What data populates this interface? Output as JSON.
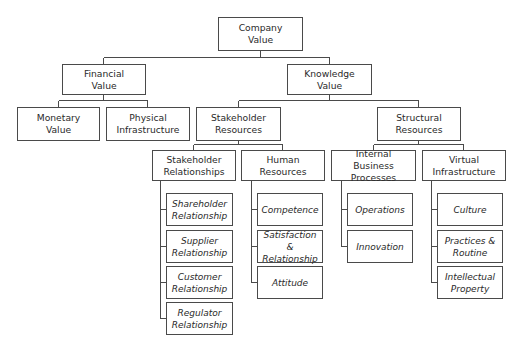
{
  "diagram": {
    "type": "hierarchy",
    "root": {
      "label": "Company\nValue"
    },
    "level1": [
      {
        "label": "Financial\nValue"
      },
      {
        "label": "Knowledge\nValue"
      }
    ],
    "financial_children": [
      {
        "label": "Monetary\nValue"
      },
      {
        "label": "Physical\nInfrastructure"
      }
    ],
    "knowledge_children": [
      {
        "label": "Stakeholder\nResources"
      },
      {
        "label": "Structural\nResources"
      }
    ],
    "stakeholder_children": [
      {
        "label": "Stakeholder\nRelationships"
      },
      {
        "label": "Human\nResources"
      }
    ],
    "structural_children": [
      {
        "label": "Internal\nBusiness Processes"
      },
      {
        "label": "Virtual\nInfrastructure"
      }
    ],
    "stakeholder_relationships_items": [
      {
        "label": "Shareholder\nRelationship"
      },
      {
        "label": "Supplier\nRelationship"
      },
      {
        "label": "Customer\nRelationship"
      },
      {
        "label": "Regulator\nRelationship"
      }
    ],
    "human_resources_items": [
      {
        "label": "Competence"
      },
      {
        "label": "Satisfaction &\nRelationship"
      },
      {
        "label": "Attitude"
      }
    ],
    "internal_business_processes_items": [
      {
        "label": "Operations"
      },
      {
        "label": "Innovation"
      }
    ],
    "virtual_infrastructure_items": [
      {
        "label": "Culture"
      },
      {
        "label": "Practices &\nRoutine"
      },
      {
        "label": "Intellectual\nProperty"
      }
    ]
  }
}
